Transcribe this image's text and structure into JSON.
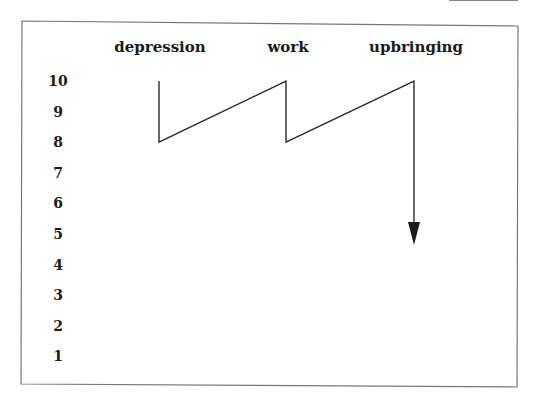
{
  "chart_data": {
    "type": "line",
    "title": "",
    "columns": [
      "depression",
      "work",
      "upbringing"
    ],
    "column_label_x": [
      160,
      288,
      416
    ],
    "y_ticks": [
      "10",
      "9",
      "8",
      "7",
      "6",
      "5",
      "4",
      "3",
      "2",
      "1"
    ],
    "ylim": [
      1,
      10
    ],
    "grid": false,
    "legend": "none",
    "path_description": "Sawtooth line: starts at depression 10, drops to 8, rises diagonally to work 10, drops to 8, rises diagonally to upbringing 10, then arrow down to 5",
    "points": [
      {
        "column": "depression",
        "value": 10
      },
      {
        "column": "depression",
        "value": 8
      },
      {
        "column": "work",
        "value": 10
      },
      {
        "column": "work",
        "value": 8
      },
      {
        "column": "upbringing",
        "value": 10
      },
      {
        "column": "upbringing",
        "value": 5
      }
    ],
    "end_marker": "arrow"
  },
  "colors": {
    "line": "#2a2a2a",
    "frame": "#777777",
    "text": "#1a1a1a"
  }
}
